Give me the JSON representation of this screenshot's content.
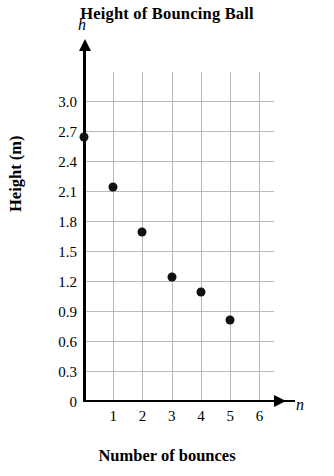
{
  "chart_data": {
    "type": "scatter",
    "title": "Height of Bouncing Ball",
    "xlabel": "Number of bounces",
    "ylabel": "Height (m)",
    "x_variable": "n",
    "y_variable": "h",
    "x": [
      0,
      1,
      2,
      3,
      4,
      5
    ],
    "values": [
      2.7,
      2.2,
      1.75,
      1.3,
      1.15,
      0.87
    ],
    "points": [
      {
        "x": 0,
        "y": 2.7
      },
      {
        "x": 1,
        "y": 2.2
      },
      {
        "x": 2,
        "y": 1.75
      },
      {
        "x": 3,
        "y": 1.3
      },
      {
        "x": 4,
        "y": 1.15
      },
      {
        "x": 5,
        "y": 0.87
      }
    ],
    "xlim": [
      0,
      6.5
    ],
    "ylim": [
      0,
      3.3
    ],
    "xticks": [
      1,
      2,
      3,
      4,
      5,
      6
    ],
    "xtick_labels": [
      "1",
      "2",
      "3",
      "4",
      "5",
      "6"
    ],
    "yticks": [
      0.3,
      0.6,
      0.9,
      1.2,
      1.5,
      1.8,
      2.1,
      2.4,
      2.7,
      3.0
    ],
    "ytick_labels": [
      "0.3",
      "0.6",
      "0.9",
      "1.2",
      "1.5",
      "1.8",
      "2.1",
      "2.4",
      "2.7",
      "3.0"
    ],
    "origin_label": "0",
    "grid": true,
    "legend": null,
    "point_color": "#111111",
    "grid_color": "#b9b9bd",
    "axis_color": "#000000"
  }
}
